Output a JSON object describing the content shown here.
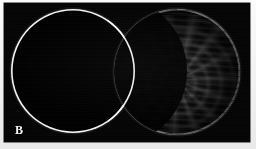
{
  "figure": {
    "panel_label": "B",
    "caption_visible": false,
    "background_color": "#f1f1f1",
    "plate_color": "#040404"
  },
  "apertures": [
    {
      "id": "left",
      "name": "reference-aperture",
      "appearance": "dark-empty-disc",
      "ring_color": "#f4f4f0",
      "fill_color": "#000000",
      "has_fringes": false
    },
    {
      "id": "right",
      "name": "fringed-aperture",
      "appearance": "spiral-interference-fringes",
      "ring_color": "#f4f4f0",
      "fill_color": "#050505",
      "has_fringes": true,
      "fringe_pattern": "forked-spiral-dislocation"
    }
  ],
  "chart_data": {
    "type": "heatmap",
    "title": "B",
    "xlabel": "",
    "ylabel": "",
    "grid": false,
    "legend": false,
    "annotations": [
      {
        "text": "B",
        "position": "bottom-left"
      }
    ]
  }
}
